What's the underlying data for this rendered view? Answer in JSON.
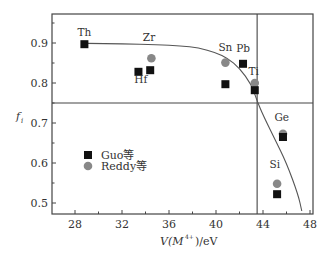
{
  "chart_data": {
    "type": "scatter",
    "title": "",
    "xlabel": "V(M 4+)/eV",
    "ylabel": "f_i",
    "xlim": [
      26,
      48
    ],
    "ylim": [
      0.475,
      0.975
    ],
    "xticks": [
      28,
      32,
      36,
      40,
      44,
      48
    ],
    "yticks": [
      0.5,
      0.6,
      0.7,
      0.8,
      0.9
    ],
    "grid": false,
    "legend_position": "lower-left",
    "reference_lines": {
      "horizontal_f": 0.75,
      "vertical_V": 43.5
    },
    "curve": {
      "description": "fitted trend curve",
      "points": [
        [
          29,
          0.899
        ],
        [
          32,
          0.898
        ],
        [
          35,
          0.896
        ],
        [
          37,
          0.893
        ],
        [
          38.5,
          0.888
        ],
        [
          40,
          0.876
        ],
        [
          41,
          0.862
        ],
        [
          42,
          0.837
        ],
        [
          43,
          0.797
        ],
        [
          43.5,
          0.755
        ],
        [
          44,
          0.72
        ],
        [
          45,
          0.66
        ],
        [
          46,
          0.6
        ],
        [
          47,
          0.52
        ],
        [
          47.3,
          0.48
        ]
      ]
    },
    "series": [
      {
        "name": "Guo等",
        "marker": "square",
        "color": "#111111",
        "points": [
          {
            "label": "Th",
            "x": 28.8,
            "y": 0.897
          },
          {
            "label": "Hf",
            "x": 33.4,
            "y": 0.828
          },
          {
            "label": "Zr",
            "x": 34.4,
            "y": 0.832
          },
          {
            "label": "Sn",
            "x": 40.8,
            "y": 0.797
          },
          {
            "label": "Pb",
            "x": 42.3,
            "y": 0.848
          },
          {
            "label": "Ti",
            "x": 43.3,
            "y": 0.782
          },
          {
            "label": "Ge",
            "x": 45.7,
            "y": 0.665
          },
          {
            "label": "Si",
            "x": 45.2,
            "y": 0.522
          }
        ]
      },
      {
        "name": "Reddy等",
        "marker": "circle",
        "color": "#888888",
        "points": [
          {
            "label": "Zr",
            "x": 34.5,
            "y": 0.862
          },
          {
            "label": "Sn",
            "x": 40.8,
            "y": 0.851
          },
          {
            "label": "Ti",
            "x": 43.3,
            "y": 0.8
          },
          {
            "label": "Ge",
            "x": 45.7,
            "y": 0.673
          },
          {
            "label": "Si",
            "x": 45.2,
            "y": 0.548
          }
        ]
      }
    ],
    "annotations": [
      {
        "text": "Th",
        "x": 28.8,
        "y": 0.918
      },
      {
        "text": "Zr",
        "x": 34.3,
        "y": 0.905
      },
      {
        "text": "Hf",
        "x": 33.6,
        "y": 0.8
      },
      {
        "text": "Sn",
        "x": 40.8,
        "y": 0.88
      },
      {
        "text": "Pb",
        "x": 42.3,
        "y": 0.878
      },
      {
        "text": "Ti",
        "x": 43.2,
        "y": 0.82
      },
      {
        "text": "Ge",
        "x": 45.6,
        "y": 0.705
      },
      {
        "text": "Si",
        "x": 45.0,
        "y": 0.587
      }
    ]
  },
  "labels": {
    "xlabel_main": "V(M",
    "xlabel_sup": "4+",
    "xlabel_tail": ")/eV",
    "ylabel_main": "f",
    "ylabel_sub": "i",
    "legend_guo": "Guo等",
    "legend_reddy": "Reddy等"
  }
}
